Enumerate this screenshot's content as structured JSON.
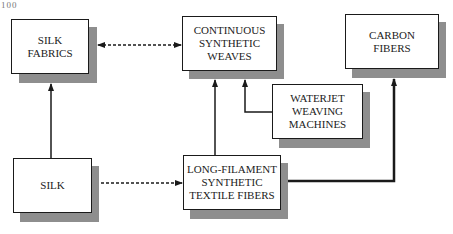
{
  "page": {
    "number": "100"
  },
  "nodes": {
    "silk_fabrics": {
      "label": "SILK\nFABRICS"
    },
    "continuous_synthetic_weaves": {
      "label": "CONTINUOUS\nSYNTHETIC\nWEAVES"
    },
    "carbon_fibers": {
      "label": "CARBON\nFIBERS"
    },
    "waterjet_weaving_machines": {
      "label": "WATERJET\nWEAVING\nMACHINES"
    },
    "silk": {
      "label": "SILK"
    },
    "long_filament_fibers": {
      "label": "LONG-FILAMENT\nSYNTHETIC\nTEXTILE FIBERS"
    }
  },
  "edges": [
    {
      "from": "silk",
      "to": "silk_fabrics",
      "style": "solid"
    },
    {
      "from": "silk",
      "to": "long_filament_fibers",
      "style": "dashed"
    },
    {
      "from": "silk_fabrics",
      "to": "continuous_synthetic_weaves",
      "style": "dashed-bidirectional"
    },
    {
      "from": "long_filament_fibers",
      "to": "continuous_synthetic_weaves",
      "style": "solid"
    },
    {
      "from": "waterjet_weaving_machines",
      "to": "continuous_synthetic_weaves",
      "style": "solid"
    },
    {
      "from": "long_filament_fibers",
      "to": "carbon_fibers",
      "style": "thick"
    }
  ],
  "colors": {
    "line": "#1a1a1a",
    "shadow": "#8e8e8e",
    "box_fill": "#ffffff"
  }
}
